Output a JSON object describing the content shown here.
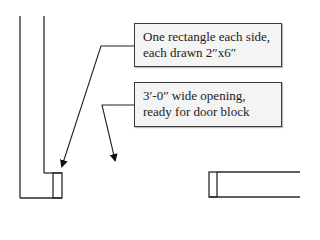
{
  "diagram": {
    "type": "floor-plan-detail",
    "callouts": [
      {
        "id": "wall-end-studs",
        "lines": [
          "One rectangle each side,",
          "each drawn 2″x6″"
        ]
      },
      {
        "id": "door-opening",
        "lines": [
          "3′-0″ wide opening,",
          "ready for door block"
        ]
      }
    ],
    "colors": {
      "line": "#2a2a2a",
      "callout_fill": "#f4f4f4",
      "callout_border": "#3a3a3a"
    }
  }
}
